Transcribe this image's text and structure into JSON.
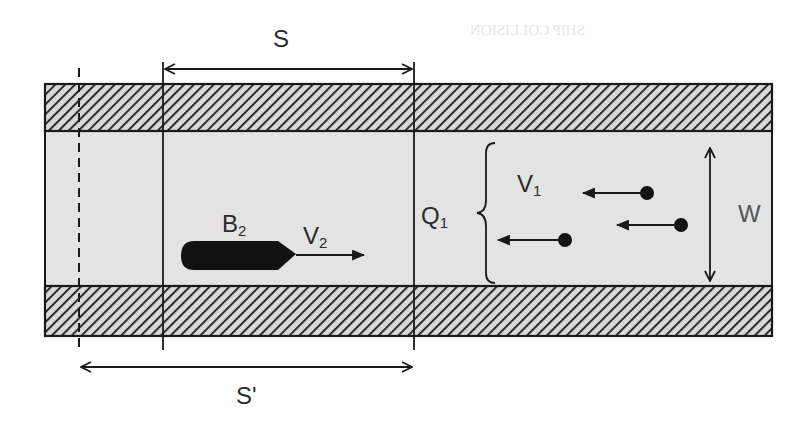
{
  "diagram": {
    "title_fragment": "SHIP COLLISION",
    "labels": {
      "segment_s": "S",
      "segment_s_prime": "S'",
      "ship_name": "B",
      "ship_name_sub": "2",
      "ship_velocity": "V",
      "ship_velocity_sub": "2",
      "flow": "Q",
      "flow_sub": "1",
      "traffic_velocity": "V",
      "traffic_velocity_sub": "1",
      "width": "W"
    },
    "colors": {
      "ink": "#1a1a1a",
      "water": "#e3e3e3",
      "bank_hatch_bg": "#d8d8d8",
      "background": "#ffffff"
    },
    "elements": {
      "channel": {
        "x": 45,
        "y": 84,
        "width": 727,
        "height": 252
      },
      "top_bank": {
        "y_top": 84,
        "y_bottom": 131
      },
      "water_lane": {
        "y_top": 131,
        "y_bottom": 286
      },
      "bottom_bank": {
        "y_top": 286,
        "y_bottom": 336
      },
      "dashed_reference_line_x": 79,
      "segment_boundary_left_x": 163,
      "segment_boundary_right_x": 414,
      "ship_b2": {
        "x_start": 181,
        "x_end": 295,
        "y_center": 256
      },
      "oncoming_ships_count": 3
    }
  }
}
